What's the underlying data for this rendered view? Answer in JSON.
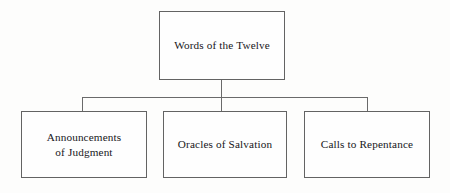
{
  "diagram": {
    "title_text": "Words of the Twelve",
    "orientation": "top-down-tree",
    "colors": {
      "background": "#fdfdfc",
      "box_fill": "#fefefe",
      "box_border": "#636363",
      "connector": "#6a6a6a",
      "text": "#17161a"
    },
    "root": {
      "label": "Words of the Twelve"
    },
    "children": [
      {
        "label": "Announcements\nof Judgment"
      },
      {
        "label": "Oracles of Salvation"
      },
      {
        "label": "Calls to Repentance"
      }
    ],
    "connectors": [
      {
        "name": "root-stem",
        "type": "vertical"
      },
      {
        "name": "bus",
        "type": "horizontal"
      },
      {
        "name": "drop-left",
        "type": "vertical"
      },
      {
        "name": "drop-middle",
        "type": "vertical"
      },
      {
        "name": "drop-right",
        "type": "vertical"
      }
    ]
  }
}
